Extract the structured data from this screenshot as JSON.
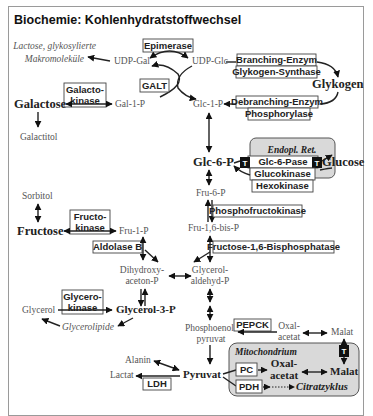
{
  "title": "Biochemie: Kohlenhydratstoffwechsel",
  "metabolites": {
    "lactose": "Lactose, glykosylierte",
    "makromolekuele": "Makromoleküle",
    "udp_gal": "UDP-Gal",
    "udp_glc": "UDP-Glc",
    "galactose": "Galactose",
    "gal_1_p": "Gal-1-P",
    "glc_1_p": "Glc-1-P",
    "glykogen": "Glykogen",
    "galactitol": "Galactitol",
    "glc_6_p": "Glc-6-P",
    "glucose": "Glucose",
    "fru_6_p": "Fru-6-P",
    "sorbitol": "Sorbitol",
    "fructose": "Fructose",
    "fru_1_p": "Fru-1-P",
    "fru_16_bis_p": "Fru-1,6-bis-P",
    "dihydroxy": "Dihydroxy-",
    "aceton_p": "aceton-P",
    "glycerol_": "Glycerol-",
    "aldehyd_p": "aldehyd-P",
    "glycerol": "Glycerol",
    "glycerol_3_p": "Glycerol-3-P",
    "glycerolipide": "Glycerolipide",
    "phosphoenol": "Phosphoenol-",
    "pyruvat_pep": "pyruvat",
    "oxal": "Oxal-",
    "acetat": "acetat",
    "malat": "Malat",
    "alanin": "Alanin",
    "lactat": "Lactat",
    "pyruvat": "Pyruvat",
    "oxal_mito": "Oxal-",
    "acetat_mito": "acetat",
    "malat_mito": "Malat",
    "citratzyklus": "Citratzyklus"
  },
  "enzymes": {
    "epimerase": "Epimerase",
    "galt": "GALT",
    "galactokinase_1": "Galacto-",
    "galactokinase_2": "kinase",
    "branching": "Branching-Enzym",
    "glykogen_synthase": "Glykogen-Synthase",
    "debranching": "Debranching-Enzym",
    "phosphorylase": "Phosphorylase",
    "glc_6_pase": "Glc-6-Pase",
    "glucokinase": "Glucokinase",
    "hexokinase": "Hexokinase",
    "fructokinase_1": "Fructo-",
    "fructokinase_2": "kinase",
    "phosphofructokinase": "Phosphofructokinase",
    "aldolase_b": "Aldolase B",
    "fbpase": "Fructose-1,6-Bisphosphatase",
    "glycerokinase_1": "Glycero-",
    "glycerokinase_2": "kinase",
    "pepck": "PEPCK",
    "ldh": "LDH",
    "pc": "PC",
    "pdh": "PDH"
  },
  "compartments": {
    "endopl_ret": "Endopl. Ret.",
    "mitochondrium": "Mitochondrium"
  },
  "transporters": {
    "t_label": "T"
  },
  "colors": {
    "compartment_fill": "#d9d9d9",
    "compartment_stroke": "#555555",
    "frame_border": "#9a9a9a",
    "metabolite_gray": "#555555"
  }
}
